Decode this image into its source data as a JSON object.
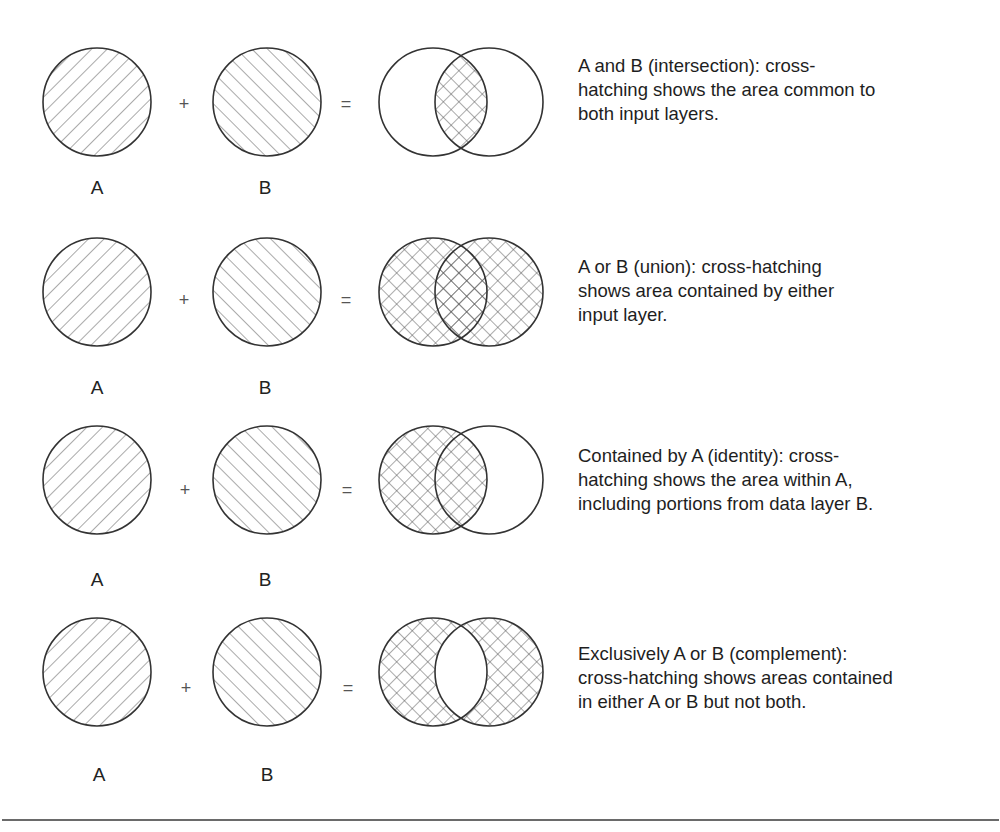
{
  "figure": {
    "line_color": "#333333",
    "hatch_color": "#555555",
    "rows": [
      {
        "operation": "intersection",
        "label_a": "A",
        "label_b": "B",
        "plus": "+",
        "equals": "=",
        "description_lines": [
          "A and B (intersection): cross-",
          "hatching shows the area common to",
          "both input layers."
        ]
      },
      {
        "operation": "union",
        "label_a": "A",
        "label_b": "B",
        "plus": "+",
        "equals": "=",
        "description_lines": [
          "A or B (union): cross-hatching",
          "shows area contained by either",
          "input layer."
        ]
      },
      {
        "operation": "identity",
        "label_a": "A",
        "label_b": "B",
        "plus": "+",
        "equals": "=",
        "description_lines": [
          "Contained by A (identity): cross-",
          "hatching shows the area within A,",
          "including portions from data layer B."
        ]
      },
      {
        "operation": "complement",
        "label_a": "A",
        "label_b": "B",
        "plus": "+",
        "equals": "=",
        "description_lines": [
          "Exclusively A or B (complement):",
          "cross-hatching shows areas contained",
          "in either A or B but not both."
        ]
      }
    ]
  }
}
